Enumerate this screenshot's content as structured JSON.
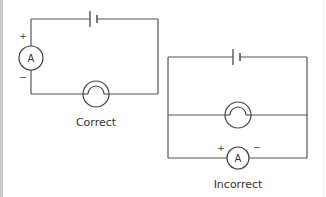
{
  "diagram": {
    "type": "circuit-comparison",
    "circuits": [
      {
        "caption": "Correct",
        "description": "Ammeter connected in series with cell and lamp",
        "components": [
          "cell",
          "ammeter",
          "lamp"
        ],
        "ammeter": {
          "letter": "A",
          "positive_sign": "+",
          "negative_sign": "−"
        }
      },
      {
        "caption": "Incorrect",
        "description": "Ammeter connected in parallel with lamp",
        "components": [
          "cell",
          "lamp",
          "ammeter"
        ],
        "ammeter": {
          "letter": "A",
          "positive_sign": "+",
          "negative_sign": "−"
        }
      }
    ],
    "colors": {
      "wire": "#555555",
      "text": "#333333",
      "border": "#c9c9c9",
      "background": "#ffffff"
    }
  }
}
